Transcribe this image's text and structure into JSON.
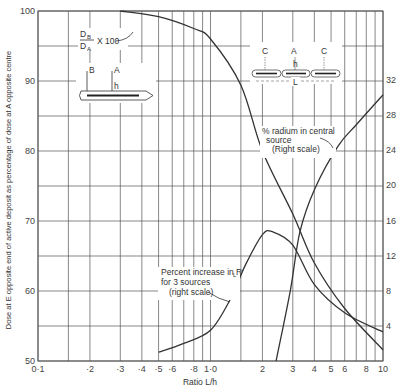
{
  "chart_data": {
    "type": "line",
    "title": "",
    "xlabel": "Ratio L/h",
    "xscale": "log",
    "xlim": [
      0.1,
      10
    ],
    "x_ticks": [
      {
        "value": 0.1,
        "label": "0·1"
      },
      {
        "value": 0.2,
        "label": "·2"
      },
      {
        "value": 0.3,
        "label": "·3"
      },
      {
        "value": 0.4,
        "label": "·4"
      },
      {
        "value": 0.5,
        "label": "·5"
      },
      {
        "value": 0.6,
        "label": "·6"
      },
      {
        "value": 0.8,
        "label": "·8"
      },
      {
        "value": 1.0,
        "label": "1·0"
      },
      {
        "value": 2,
        "label": "2"
      },
      {
        "value": 3,
        "label": "3"
      },
      {
        "value": 4,
        "label": "4"
      },
      {
        "value": 5,
        "label": "5"
      },
      {
        "value": 6,
        "label": "6"
      },
      {
        "value": 8,
        "label": "8"
      },
      {
        "value": 10,
        "label": "10"
      }
    ],
    "x_gridlines": [
      0.1,
      0.15,
      0.2,
      0.3,
      0.4,
      0.5,
      0.6,
      0.7,
      0.8,
      0.9,
      1.0,
      1.5,
      2,
      3,
      4,
      5,
      6,
      7,
      8,
      9,
      10
    ],
    "ylabel_left": "Dose at E opposite end of active deposit as percentage of dose at A opposite centre",
    "ylim_left": [
      50,
      100
    ],
    "y_ticks_left": [
      50,
      60,
      70,
      80,
      90,
      100
    ],
    "y_gridlines_left": [
      50,
      55,
      60,
      65,
      70,
      75,
      80,
      85,
      90,
      95,
      100
    ],
    "ylim_right": [
      0,
      32
    ],
    "y_ticks_right": [
      4,
      8,
      12,
      16,
      20,
      24,
      28,
      32
    ],
    "grid": true,
    "series": [
      {
        "name": "DB/DA x 100",
        "axis": "left",
        "x": [
          0.3,
          0.5,
          0.8,
          1.0,
          1.5,
          2.0,
          3.0,
          4.0,
          6.0,
          10.0
        ],
        "y": [
          100,
          99.2,
          97.5,
          96.0,
          89.4,
          80.0,
          71.0,
          64.0,
          57.5,
          51.6
        ]
      },
      {
        "name": "Percent increase in R_L for 3 sources (right scale)",
        "axis": "right",
        "x": [
          0.5,
          0.7,
          1.0,
          1.3,
          1.6,
          2.0,
          2.3,
          3.0,
          4.0,
          6.0,
          10.0
        ],
        "y": [
          1.0,
          2.0,
          3.5,
          7.0,
          11.0,
          14.4,
          14.7,
          13.2,
          8.7,
          5.5,
          3.3
        ]
      },
      {
        "name": "% radium in central source (Right scale)",
        "axis": "right",
        "x": [
          2.4,
          2.9,
          3.3,
          4.0,
          5.5,
          7.0,
          10.0
        ],
        "y": [
          0,
          8.0,
          14.7,
          19.5,
          24.5,
          26.9,
          30.3
        ]
      }
    ],
    "annotations": [
      {
        "text": "DB/DA x 100",
        "points_to": "series 0"
      },
      {
        "text": "% radium in central source (Right scale)",
        "points_to": "series 2"
      },
      {
        "text": "Percent increase in RL for 3 sources (right scale)",
        "points_to": "series 1"
      }
    ],
    "insets": [
      {
        "name": "single-source-diagram",
        "labels": [
          "B",
          "A",
          "h"
        ]
      },
      {
        "name": "three-source-diagram",
        "labels": [
          "C",
          "A",
          "C",
          "h",
          "L"
        ]
      }
    ]
  },
  "labels": {
    "xlabel": "Ratio L/h",
    "ylabel_left": "Dose at E opposite end of active deposit as percentage of dose at A opposite centre",
    "db": "D",
    "db_sub": "B",
    "da": "D",
    "da_sub": "A",
    "x100": "X 100",
    "radium_line1": "% radium in central",
    "radium_line2": "source",
    "radium_line3": "(Right scale)",
    "pct_line1": "Percent increase in R",
    "pct_sub": "L",
    "pct_line2": "for 3 sources",
    "pct_line3": "(right scale)",
    "inset1_B": "B",
    "inset1_A": "A",
    "inset1_h": "h",
    "inset2_C1": "C",
    "inset2_A": "A",
    "inset2_C2": "C",
    "inset2_h": "h",
    "inset2_L": "L"
  },
  "colors": {
    "grid": "#555555",
    "curve": "#333333",
    "text": "#444444",
    "background": "#ffffff"
  }
}
